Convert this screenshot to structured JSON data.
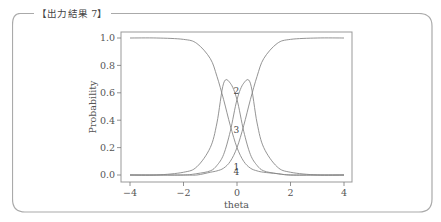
{
  "box": {
    "caption": "【出力結果 7】"
  },
  "chart_data": {
    "type": "line",
    "title": "",
    "xlabel": "theta",
    "ylabel": "Probability",
    "xlim": [
      -4,
      4
    ],
    "ylim": [
      0,
      1
    ],
    "x_ticks": [
      "−4",
      "−2",
      "0",
      "2",
      "4"
    ],
    "y_ticks": [
      "0.0",
      "0.2",
      "0.4",
      "0.6",
      "0.8",
      "1.0"
    ],
    "grid": false,
    "legend": "none; curves labeled inline 1–4",
    "x": [
      -4,
      -3,
      -2,
      -1.5,
      -1,
      -0.75,
      -0.5,
      -0.25,
      0,
      0.25,
      0.5,
      0.75,
      1,
      1.5,
      2,
      3,
      4
    ],
    "series": [
      {
        "name": "1",
        "values": [
          1.0,
          1.0,
          0.99,
          0.96,
          0.85,
          0.72,
          0.55,
          0.36,
          0.2,
          0.1,
          0.05,
          0.03,
          0.02,
          0.01,
          0.0,
          0.0,
          0.0
        ]
      },
      {
        "name": "2",
        "values": [
          0.0,
          0.0,
          0.02,
          0.06,
          0.2,
          0.38,
          0.67,
          0.67,
          0.55,
          0.32,
          0.15,
          0.07,
          0.03,
          0.01,
          0.0,
          0.0,
          0.0
        ]
      },
      {
        "name": "3",
        "values": [
          0.0,
          0.0,
          0.0,
          0.01,
          0.03,
          0.07,
          0.15,
          0.32,
          0.55,
          0.67,
          0.67,
          0.38,
          0.2,
          0.06,
          0.02,
          0.0,
          0.0
        ]
      },
      {
        "name": "4",
        "values": [
          0.0,
          0.0,
          0.0,
          0.0,
          0.02,
          0.03,
          0.05,
          0.1,
          0.2,
          0.36,
          0.55,
          0.72,
          0.85,
          0.96,
          0.99,
          1.0,
          1.0
        ]
      }
    ],
    "annotations": [
      {
        "text": "2",
        "x": -0.1,
        "y": 0.61
      },
      {
        "text": "3",
        "x": -0.1,
        "y": 0.33
      },
      {
        "text": "1",
        "x": -0.1,
        "y": 0.06
      },
      {
        "text": "4",
        "x": -0.1,
        "y": 0.02
      }
    ]
  }
}
